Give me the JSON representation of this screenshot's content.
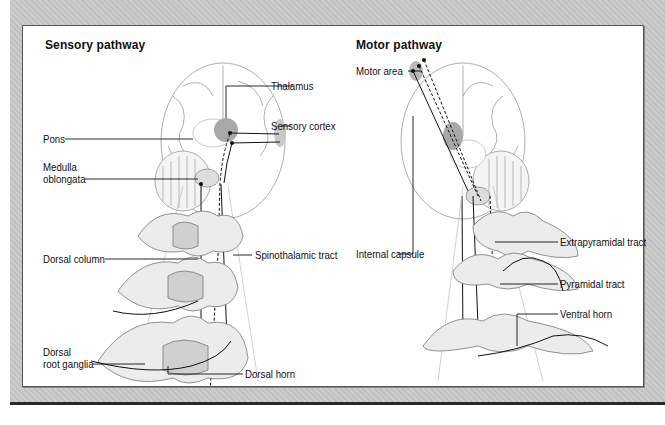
{
  "sensory": {
    "title": "Sensory pathway",
    "labels": {
      "thalamus": "Thalamus",
      "sensory_cortex": "Sensory cortex",
      "pons": "Pons",
      "medulla_line1": "Medulla",
      "medulla_line2": "oblongata",
      "dorsal_column": "Dorsal column",
      "spinothalamic_tract": "Spinothalamic tract",
      "dorsal_root_line1": "Dorsal",
      "dorsal_root_line2": "root ganglia",
      "dorsal_horn": "Dorsal horn"
    }
  },
  "motor": {
    "title": "Motor pathway",
    "labels": {
      "motor_area": "Motor area",
      "internal_capsule": "Internal capsule",
      "extrapyramidal_tract": "Extrapyramidal tract",
      "pyramidal_tract": "Pyramidal tract",
      "ventral_horn": "Ventral horn"
    }
  },
  "colors": {
    "background": "#c9c9c9",
    "panel": "#ffffff",
    "highlight": "#a8a8a8",
    "outline": "#555555"
  }
}
